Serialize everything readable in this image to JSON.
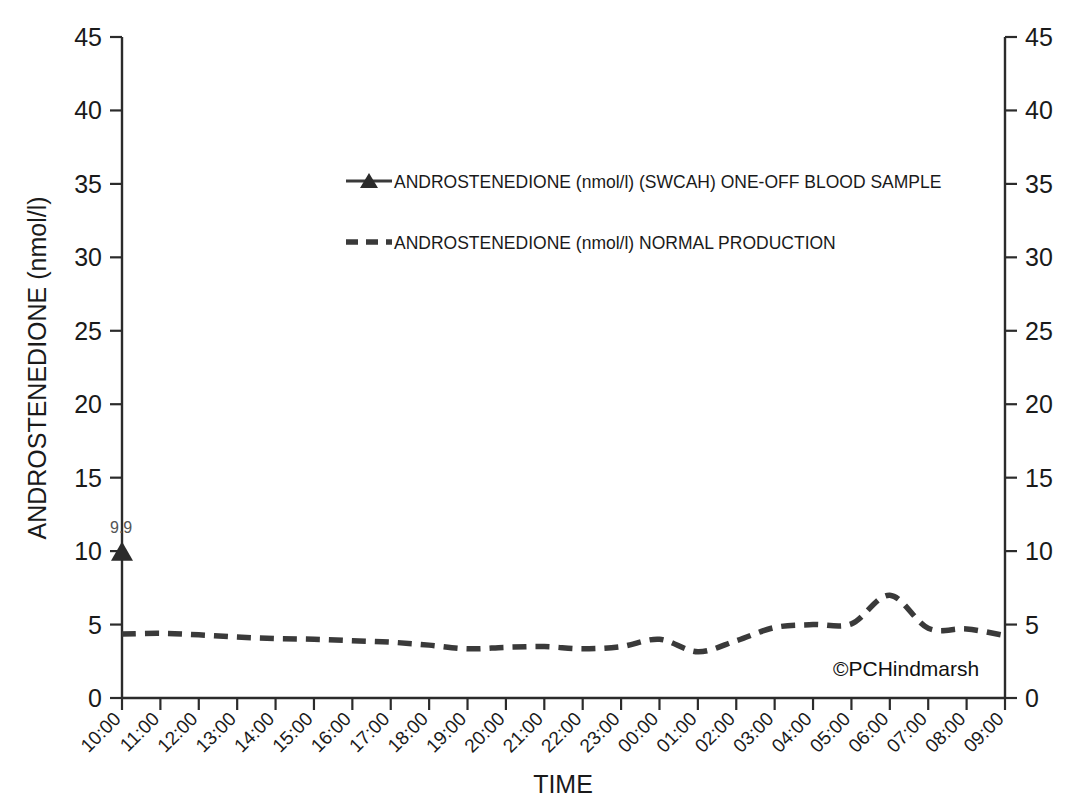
{
  "chart_data": {
    "type": "line",
    "title": "",
    "xlabel": "TIME",
    "ylabel": "ANDROSTENEDIONE (nmol/l)",
    "ylim": [
      0,
      45
    ],
    "ytick_step": 5,
    "yticks": [
      0,
      5,
      10,
      15,
      20,
      25,
      30,
      35,
      40,
      45
    ],
    "yticks_right": [
      0,
      5,
      10,
      15,
      20,
      25,
      30,
      35,
      40,
      45
    ],
    "grid": false,
    "legend_position": "upper-center",
    "categories": [
      "10:00",
      "11:00",
      "12:00",
      "13:00",
      "14:00",
      "15:00",
      "16:00",
      "17:00",
      "18:00",
      "19:00",
      "20:00",
      "21:00",
      "22:00",
      "23:00",
      "00:00",
      "01:00",
      "02:00",
      "03:00",
      "04:00",
      "05:00",
      "06:00",
      "07:00",
      "08:00",
      "09:00"
    ],
    "series": [
      {
        "name": "ANDROSTENEDIONE (nmol/l) (SWCAH) ONE-OFF BLOOD SAMPLE",
        "style": "solid-marker",
        "marker": "triangle",
        "color": "#2b2b2b",
        "points": [
          {
            "x": "10:00",
            "y": 9.9,
            "label": "9.9"
          }
        ]
      },
      {
        "name": "ANDROSTENEDIONE (nmol/l) NORMAL PRODUCTION",
        "style": "dashed",
        "color": "#3a3a3a",
        "values": [
          4.35,
          4.4,
          4.3,
          4.15,
          4.05,
          4.0,
          3.9,
          3.8,
          3.6,
          3.35,
          3.45,
          3.5,
          3.35,
          3.5,
          4.0,
          3.15,
          3.9,
          4.8,
          5.0,
          5.05,
          7.0,
          4.75,
          4.7,
          4.25
        ]
      }
    ],
    "annotations": [
      {
        "name": "copyright",
        "text": "©PCHindmarsh"
      }
    ]
  },
  "legend": {
    "items": [
      {
        "label": "ANDROSTENEDIONE (nmol/l) (SWCAH) ONE-OFF BLOOD SAMPLE",
        "key": "line-triangle"
      },
      {
        "label": "ANDROSTENEDIONE (nmol/l) NORMAL PRODUCTION",
        "key": "dashed-line"
      }
    ]
  },
  "axes": {
    "y_left_title": "ANDROSTENEDIONE (nmol/l)",
    "x_title": "TIME"
  },
  "watermark": "©PCHindmarsh",
  "colors": {
    "series": "#3a3a3a",
    "axis": "#2b2b2b",
    "marker": "#2b2b2b",
    "label": "#555555",
    "background": "#ffffff"
  }
}
